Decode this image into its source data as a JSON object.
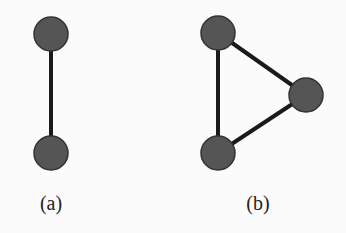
{
  "diagrams": [
    {
      "id": "a",
      "caption": "(a)",
      "caption_pos": [
        51,
        192
      ],
      "nodes": [
        [
          51,
          34
        ],
        [
          51,
          153
        ]
      ],
      "edges": [
        [
          0,
          1
        ]
      ]
    },
    {
      "id": "b",
      "caption": "(b)",
      "caption_pos": [
        258,
        192
      ],
      "nodes": [
        [
          218,
          33
        ],
        [
          306,
          95
        ],
        [
          218,
          153
        ]
      ],
      "edges": [
        [
          0,
          1
        ],
        [
          1,
          2
        ],
        [
          2,
          0
        ]
      ]
    }
  ],
  "style": {
    "node_fill": "#555555",
    "node_stroke": "#333333",
    "edge_color": "#1a1a1a",
    "node_radius": 17,
    "edge_width": 4
  }
}
